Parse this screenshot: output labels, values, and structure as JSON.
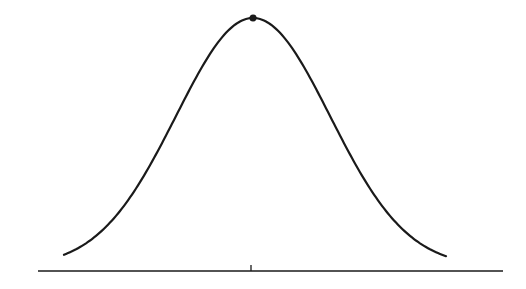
{
  "chart_data": {
    "type": "line",
    "title": "",
    "xlabel": "",
    "ylabel": "",
    "curve": {
      "kind": "gaussian",
      "mean_px": 253,
      "sigma_px": 77,
      "x_start_px": 64,
      "x_end_px": 446,
      "peak_y_px": 18,
      "base_y_px": 271,
      "tail_offset_px": 4
    },
    "peak_marker": {
      "x_px": 253,
      "y_px": 18,
      "radius_px": 3.5
    },
    "axis": {
      "x1_px": 38,
      "x2_px": 503,
      "y_px": 271
    },
    "center_tick": {
      "x_px": 251,
      "y1_px": 265,
      "y2_px": 271
    },
    "colors": {
      "stroke": "#1a1a1a",
      "background": "#ffffff"
    }
  }
}
